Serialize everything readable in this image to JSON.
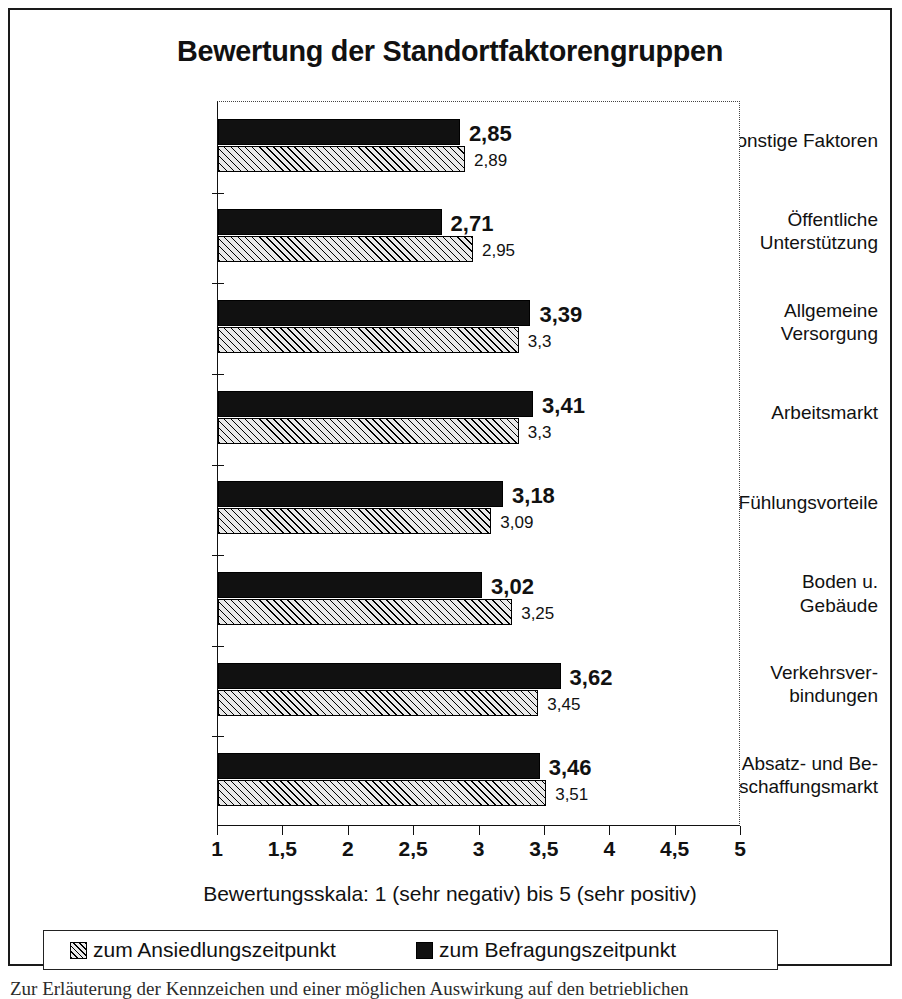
{
  "chart_data": {
    "type": "bar",
    "orientation": "horizontal",
    "title": "Bewertung der Standortfaktorengruppen",
    "xlabel": "Bewertungsskala: 1 (sehr negativ) bis 5 (sehr positiv)",
    "ylabel": "",
    "xlim": [
      1,
      5
    ],
    "xticks": [
      "1",
      "1,5",
      "2",
      "2,5",
      "3",
      "3,5",
      "4",
      "4,5",
      "5"
    ],
    "xtick_values": [
      1,
      1.5,
      2,
      2.5,
      3,
      3.5,
      4,
      4.5,
      5
    ],
    "grid": false,
    "legend_position": "bottom",
    "categories": [
      "sonstige Faktoren",
      "Öffentliche Unterstützung",
      "Allgemeine Versorgung",
      "Arbeitsmarkt",
      "Fühlungsvorteile",
      "Boden u. Gebäude",
      "Verkehrsverbindungen",
      "Absatz- und Beschaffungsmarkt"
    ],
    "category_lines": [
      [
        "sonstige Faktoren"
      ],
      [
        "Öffentliche",
        "Unterstützung"
      ],
      [
        "Allgemeine",
        "Versorgung"
      ],
      [
        "Arbeitsmarkt"
      ],
      [
        "Fühlungsvorteile"
      ],
      [
        "Boden u.",
        "Gebäude"
      ],
      [
        "Verkehrsver-",
        "bindungen"
      ],
      [
        "Absatz- und Be-",
        "schaffungsmarkt"
      ]
    ],
    "series": [
      {
        "name": "zum Befragungszeitpunkt",
        "key": "current",
        "style": "solid-black",
        "color": "#111111",
        "values": [
          2.85,
          2.71,
          3.39,
          3.41,
          3.18,
          3.02,
          3.62,
          3.46
        ],
        "labels": [
          "2,85",
          "2,71",
          "3,39",
          "3,41",
          "3,18",
          "3,02",
          "3,62",
          "3,46"
        ]
      },
      {
        "name": "zum Ansiedlungszeitpunkt",
        "key": "initial",
        "style": "diagonal-hatch",
        "color": "#e9e9e9",
        "values": [
          2.89,
          2.95,
          3.3,
          3.3,
          3.09,
          3.25,
          3.45,
          3.51
        ],
        "labels": [
          "2,89",
          "2,95",
          "3,3",
          "3,3",
          "3,09",
          "3,25",
          "3,45",
          "3,51"
        ]
      }
    ]
  },
  "legend": {
    "entries": [
      {
        "label": "zum Ansiedlungszeitpunkt",
        "swatch": "hatched-swatch"
      },
      {
        "label": "zum Befragungszeitpunkt",
        "swatch": "solid-black-swatch"
      }
    ]
  },
  "caption": {
    "cutoff_text": "Zur Erläuterung der Kennzeichen und einer möglichen Auswirkung auf den betrieblichen"
  }
}
